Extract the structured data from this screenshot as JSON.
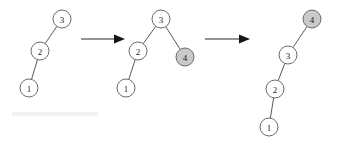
{
  "figure": {
    "width": 341,
    "height": 146,
    "background_color": "#ffffff",
    "node_outline_color": "#6b6b6b",
    "node_plain_fill": "#ffffff",
    "node_shaded_fill": "#c9c9c9",
    "edge_color": "#5a5a5a",
    "arrow_color": "#151515"
  },
  "trees": [
    {
      "name": "tree-1",
      "nodes": [
        {
          "id": "t1-n3",
          "label": "3",
          "cx": 62,
          "cy": 19,
          "r": 9,
          "shaded": false
        },
        {
          "id": "t1-n2",
          "label": "2",
          "cx": 40,
          "cy": 51,
          "r": 9,
          "shaded": false
        },
        {
          "id": "t1-n1",
          "label": "1",
          "cx": 29,
          "cy": 88,
          "r": 9,
          "shaded": false
        }
      ],
      "edges": [
        {
          "from": "t1-n3",
          "to": "t1-n2"
        },
        {
          "from": "t1-n2",
          "to": "t1-n1"
        }
      ]
    },
    {
      "name": "tree-2",
      "nodes": [
        {
          "id": "t2-n3",
          "label": "3",
          "cx": 161,
          "cy": 19,
          "r": 9,
          "shaded": false
        },
        {
          "id": "t2-n2",
          "label": "2",
          "cx": 138,
          "cy": 51,
          "r": 9,
          "shaded": false
        },
        {
          "id": "t2-n4",
          "label": "4",
          "cx": 185,
          "cy": 57,
          "r": 9,
          "shaded": true
        },
        {
          "id": "t2-n1",
          "label": "1",
          "cx": 126,
          "cy": 88,
          "r": 9,
          "shaded": false
        }
      ],
      "edges": [
        {
          "from": "t2-n3",
          "to": "t2-n2"
        },
        {
          "from": "t2-n3",
          "to": "t2-n4"
        },
        {
          "from": "t2-n2",
          "to": "t2-n1"
        }
      ]
    },
    {
      "name": "tree-3",
      "nodes": [
        {
          "id": "t3-n4",
          "label": "4",
          "cx": 312,
          "cy": 19,
          "r": 9,
          "shaded": true
        },
        {
          "id": "t3-n3",
          "label": "3",
          "cx": 288,
          "cy": 55,
          "r": 9,
          "shaded": false
        },
        {
          "id": "t3-n2",
          "label": "2",
          "cx": 275,
          "cy": 89,
          "r": 9,
          "shaded": false
        },
        {
          "id": "t3-n1",
          "label": "1",
          "cx": 269,
          "cy": 127,
          "r": 9,
          "shaded": false
        }
      ],
      "edges": [
        {
          "from": "t3-n4",
          "to": "t3-n3"
        },
        {
          "from": "t3-n3",
          "to": "t3-n2"
        },
        {
          "from": "t3-n2",
          "to": "t3-n1"
        }
      ]
    }
  ],
  "arrows": [
    {
      "name": "arrow-1",
      "x1": 81,
      "x2": 125,
      "y": 39
    },
    {
      "name": "arrow-2",
      "x1": 205,
      "x2": 250,
      "y": 39
    }
  ]
}
